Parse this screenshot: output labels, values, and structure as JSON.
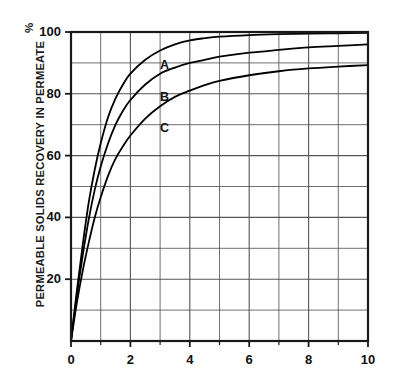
{
  "chart_data": {
    "type": "line",
    "title": "",
    "subtitle": "",
    "xlabel": "",
    "ylabel": "PERMEABLE SOLIDS RECOVERY IN PERMEATE",
    "yunit": "%",
    "xlim": [
      0,
      10
    ],
    "ylim": [
      0,
      100
    ],
    "grid": true,
    "grid_minor_x_step": 1,
    "grid_minor_y_step": 10,
    "legend_position": "inline-curve-labels",
    "x_ticks_major": [
      "0",
      "2",
      "4",
      "6",
      "8",
      "10"
    ],
    "x_tick_values": [
      0,
      2,
      4,
      6,
      8,
      10
    ],
    "y_ticks_major": [
      "20",
      "40",
      "60",
      "80",
      "100"
    ],
    "y_tick_values": [
      20,
      40,
      60,
      80,
      100
    ],
    "series": [
      {
        "name": "A",
        "label": "A",
        "label_x": 3.0,
        "label_y": 89.0,
        "x": [
          0,
          0.2,
          0.4,
          0.6,
          0.8,
          1.0,
          1.25,
          1.5,
          1.75,
          2.0,
          2.5,
          3.0,
          3.5,
          4.0,
          4.5,
          5.0,
          6.0,
          7.0,
          8.0,
          9.0,
          10.0
        ],
        "values": [
          0,
          16.5,
          31.5,
          45.0,
          55.5,
          64.0,
          72.5,
          78.5,
          83.0,
          86.5,
          91.0,
          94.0,
          96.0,
          97.3,
          98.0,
          98.5,
          99.0,
          99.3,
          99.5,
          99.6,
          99.7
        ]
      },
      {
        "name": "B",
        "label": "B",
        "label_x": 3.0,
        "label_y": 78.5,
        "x": [
          0,
          0.2,
          0.4,
          0.6,
          0.8,
          1.0,
          1.25,
          1.5,
          1.75,
          2.0,
          2.5,
          3.0,
          3.5,
          4.0,
          4.5,
          5.0,
          6.0,
          7.0,
          8.0,
          9.0,
          10.0
        ],
        "values": [
          0,
          15.0,
          28.0,
          39.5,
          49.0,
          56.5,
          64.0,
          70.0,
          74.5,
          78.0,
          83.0,
          86.5,
          88.5,
          90.0,
          91.0,
          92.0,
          93.3,
          94.2,
          95.0,
          95.5,
          96.0
        ]
      },
      {
        "name": "C",
        "label": "C",
        "label_x": 3.0,
        "label_y": 68.5,
        "x": [
          0,
          0.2,
          0.4,
          0.6,
          0.8,
          1.0,
          1.25,
          1.5,
          1.75,
          2.0,
          2.5,
          3.0,
          3.5,
          4.0,
          4.5,
          5.0,
          6.0,
          7.0,
          8.0,
          9.0,
          10.0
        ],
        "values": [
          0,
          12.5,
          23.0,
          32.0,
          40.0,
          46.5,
          53.5,
          59.0,
          63.0,
          66.5,
          72.0,
          76.0,
          79.0,
          81.0,
          82.8,
          84.2,
          86.0,
          87.3,
          88.2,
          88.8,
          89.3
        ]
      }
    ]
  },
  "axes": {
    "frame_color": "#1a1a1a",
    "grid_color": "#555555",
    "curve_color": "#000000"
  }
}
